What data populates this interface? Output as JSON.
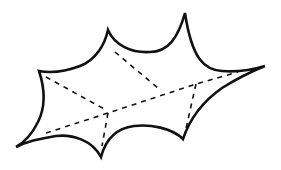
{
  "figure": {
    "background_color": "#ffffff",
    "line_color": "#111111",
    "vertices": {
      "left_point": [
        16,
        147
      ],
      "upper_left_corner": [
        39,
        71
      ],
      "top_left_spike": [
        108,
        30
      ],
      "top_right_spike": [
        185,
        13
      ],
      "right_point": [
        265,
        66
      ],
      "bottom_right_spike": [
        183,
        139
      ],
      "bottom_spike": [
        101,
        157
      ]
    },
    "dashed_lines": [
      {
        "name": "upper-left-to-center",
        "from": [
          46,
          77
        ],
        "to": [
          106,
          110
        ]
      },
      {
        "name": "top-left-to-mid",
        "from": [
          115,
          52
        ],
        "to": [
          158,
          88
        ]
      },
      {
        "name": "long-diagonal",
        "from": [
          46,
          133
        ],
        "to": [
          238,
          72
        ]
      },
      {
        "name": "center-to-bottom",
        "from": [
          108,
          113
        ],
        "to": [
          102,
          146
        ]
      },
      {
        "name": "right-inner-to-bottom-right",
        "from": [
          196,
          84
        ],
        "to": [
          185,
          133
        ]
      }
    ]
  }
}
